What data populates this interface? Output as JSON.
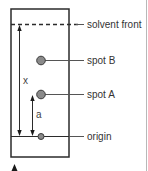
{
  "diagram": {
    "labels": {
      "solvent_front": "solvent front",
      "spot_b": "spot B",
      "spot_a": "spot A",
      "origin": "origin"
    },
    "measurements": {
      "x": "x",
      "a": "a"
    },
    "colors": {
      "outline": "#2b2b2b",
      "spot_fill": "#8a8a8a",
      "spot_stroke": "#3a3a3a",
      "leader_line": "#555555",
      "edge_rule": "#b8b8b8"
    }
  }
}
